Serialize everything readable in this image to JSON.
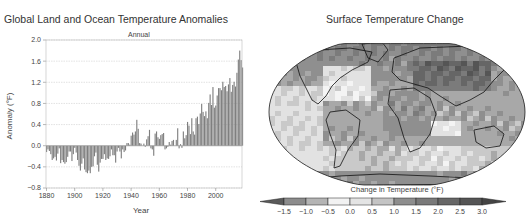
{
  "left_panel": {
    "title": "Global Land and Ocean Temperature Anomalies",
    "subtitle": "Annual",
    "xlabel": "Year",
    "ylabel": "Anomaly (°F)"
  },
  "right_panel": {
    "title": "Surface Temperature Change",
    "colorbar_label": "Change in Temperature (°F)",
    "colorbar_ticks": [
      "−1.5",
      "−1.0",
      "−0.5",
      "0.0",
      "0.5",
      "1.0",
      "1.5",
      "2.0",
      "2.5",
      "3.0"
    ],
    "colorbar_colors": [
      "#5a5a5a",
      "#8c8c8c",
      "#b4b4b4",
      "#f2f2f2",
      "#e4e4e4",
      "#c4c4c4",
      "#8e8e8e",
      "#7a7a7a",
      "#676767",
      "#555555",
      "#444444"
    ]
  },
  "chart_data": [
    {
      "type": "bar",
      "title": "Global Land and Ocean Temperature Anomalies",
      "subtitle": "Annual",
      "xlabel": "Year",
      "ylabel": "Anomaly (°F)",
      "ylim": [
        -0.8,
        2.0
      ],
      "yticks": [
        2.0,
        1.6,
        1.2,
        0.8,
        0.4,
        0.0,
        -0.4,
        -0.8
      ],
      "xlim": [
        1880,
        2018
      ],
      "xticks": [
        1880,
        1900,
        1920,
        1940,
        1960,
        1980,
        2000
      ],
      "grid": true,
      "x_start": 1880,
      "values": [
        -0.12,
        -0.07,
        -0.1,
        -0.16,
        -0.27,
        -0.24,
        -0.21,
        -0.28,
        -0.15,
        -0.05,
        -0.33,
        -0.27,
        -0.31,
        -0.34,
        -0.31,
        -0.21,
        -0.11,
        -0.11,
        -0.29,
        -0.16,
        -0.04,
        -0.13,
        -0.27,
        -0.38,
        -0.47,
        -0.34,
        -0.24,
        -0.45,
        -0.5,
        -0.52,
        -0.47,
        -0.52,
        -0.4,
        -0.39,
        -0.2,
        -0.13,
        -0.36,
        -0.49,
        -0.32,
        -0.25,
        -0.25,
        -0.16,
        -0.27,
        -0.24,
        -0.25,
        -0.2,
        -0.07,
        -0.18,
        -0.18,
        -0.32,
        -0.11,
        -0.04,
        -0.11,
        -0.24,
        -0.07,
        -0.12,
        -0.09,
        0.05,
        0.05,
        0.02,
        0.19,
        0.25,
        0.21,
        0.27,
        0.49,
        0.32,
        0.05,
        0.04,
        0.0,
        0.04,
        -0.02,
        0.12,
        0.18,
        0.3,
        -0.05,
        -0.07,
        -0.19,
        0.23,
        0.27,
        0.16,
        0.13,
        0.2,
        0.22,
        0.24,
        -0.07,
        -0.05,
        -0.02,
        0.07,
        0.02,
        0.09,
        0.11,
        0.0,
        0.11,
        0.33,
        -0.05,
        0.03,
        -0.04,
        0.27,
        0.14,
        0.2,
        0.45,
        0.38,
        0.22,
        0.52,
        0.27,
        0.21,
        0.52,
        0.55,
        0.41,
        0.61,
        0.79,
        0.64,
        0.56,
        0.65,
        0.52,
        0.81,
        0.97,
        0.77,
        1.11,
        0.72,
        0.76,
        0.95,
        1.09,
        1.09,
        1.05,
        1.21,
        1.11,
        1.13,
        1.03,
        1.16,
        1.28,
        1.02,
        1.15,
        1.21,
        1.12,
        1.38,
        1.63,
        1.8,
        1.62,
        1.48
      ],
      "bar_color": "#7f7f7f"
    },
    {
      "type": "heatmap",
      "title": "Surface Temperature Change",
      "projection": "Robinson world map",
      "colorbar_label": "Change in Temperature (°F)",
      "colorbar_ticks": [
        -1.5,
        -1.0,
        -0.5,
        0.0,
        0.5,
        1.0,
        1.5,
        2.0,
        2.5,
        3.0
      ],
      "colorbar_extend": "both"
    }
  ]
}
